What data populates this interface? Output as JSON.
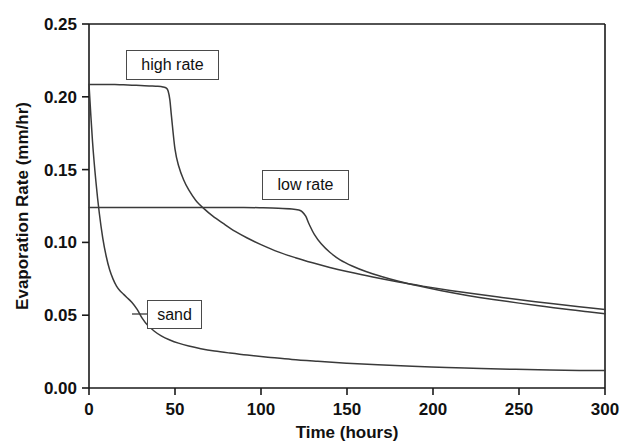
{
  "chart_data": {
    "type": "line",
    "title": "",
    "xlabel": "Time (hours)",
    "ylabel": "Evaporation Rate (mm/hr)",
    "xlim": [
      0,
      300
    ],
    "ylim": [
      0.0,
      0.25
    ],
    "xticks": [
      0,
      50,
      100,
      150,
      200,
      250,
      300
    ],
    "yticks": [
      0.0,
      0.05,
      0.1,
      0.15,
      0.2,
      0.25
    ],
    "xticklabels": [
      "0",
      "50",
      "100",
      "150",
      "200",
      "250",
      "300"
    ],
    "yticklabels": [
      "0.00",
      "0.05",
      "0.10",
      "0.15",
      "0.20",
      "0.25"
    ],
    "grid": false,
    "legend_position": "inline-callouts",
    "annotations": [
      {
        "label": "high rate",
        "x": 47,
        "y": 0.208
      },
      {
        "label": "low rate",
        "x": 125,
        "y": 0.124
      },
      {
        "label": "sand",
        "x": 25,
        "y": 0.035
      }
    ],
    "series": [
      {
        "name": "high rate",
        "x": [
          0,
          5,
          10,
          15,
          20,
          25,
          30,
          35,
          40,
          43,
          45,
          46,
          47,
          48,
          50,
          52,
          55,
          58,
          62,
          67,
          72,
          78,
          85,
          92,
          100,
          110,
          120,
          130,
          140,
          150,
          165,
          180,
          195,
          210,
          225,
          240,
          255,
          270,
          285,
          300
        ],
        "y": [
          0.2085,
          0.2085,
          0.2085,
          0.2085,
          0.2082,
          0.208,
          0.2078,
          0.2075,
          0.2072,
          0.2068,
          0.206,
          0.204,
          0.198,
          0.186,
          0.164,
          0.153,
          0.143,
          0.136,
          0.129,
          0.123,
          0.118,
          0.113,
          0.1075,
          0.103,
          0.0985,
          0.0935,
          0.0895,
          0.086,
          0.0828,
          0.08,
          0.0762,
          0.0728,
          0.0698,
          0.067,
          0.0645,
          0.0622,
          0.06,
          0.0578,
          0.0558,
          0.054
        ]
      },
      {
        "name": "low rate",
        "x": [
          0,
          10,
          20,
          30,
          40,
          50,
          60,
          70,
          80,
          90,
          100,
          110,
          118,
          122,
          124,
          126,
          128,
          131,
          135,
          140,
          146,
          153,
          161,
          170,
          180,
          192,
          205,
          220,
          235,
          250,
          265,
          280,
          290,
          300
        ],
        "y": [
          0.124,
          0.124,
          0.124,
          0.124,
          0.124,
          0.124,
          0.124,
          0.124,
          0.124,
          0.124,
          0.1238,
          0.1235,
          0.123,
          0.1222,
          0.121,
          0.118,
          0.1125,
          0.1055,
          0.099,
          0.0932,
          0.088,
          0.0838,
          0.08,
          0.0766,
          0.0733,
          0.07,
          0.0668,
          0.0636,
          0.0608,
          0.0583,
          0.056,
          0.0537,
          0.0524,
          0.051
        ]
      },
      {
        "name": "sand",
        "x": [
          0,
          2,
          4,
          6,
          8,
          10,
          12,
          14,
          16,
          18,
          20,
          22,
          25,
          28,
          31,
          34,
          38,
          42,
          47,
          52,
          58,
          65,
          73,
          82,
          92,
          104,
          118,
          133,
          150,
          168,
          188,
          208,
          228,
          248,
          268,
          285,
          300
        ],
        "y": [
          0.2085,
          0.17,
          0.142,
          0.12,
          0.103,
          0.0905,
          0.0812,
          0.0748,
          0.07,
          0.0668,
          0.0645,
          0.0622,
          0.0588,
          0.054,
          0.0478,
          0.0432,
          0.039,
          0.0358,
          0.033,
          0.0308,
          0.0288,
          0.027,
          0.0254,
          0.024,
          0.0226,
          0.0212,
          0.0196,
          0.0183,
          0.017,
          0.0159,
          0.0149,
          0.0141,
          0.0134,
          0.0128,
          0.0124,
          0.0121,
          0.012
        ]
      }
    ]
  },
  "axes": {
    "x_title": "Time (hours)",
    "y_title": "Evaporation Rate (mm/hr)"
  },
  "callouts": {
    "high_rate": "high rate",
    "low_rate": "low rate",
    "sand": "sand"
  },
  "colors": {
    "background": "#ffffff",
    "axis": "#1a1a1a",
    "curve": "#3a3a3a",
    "callout_border": "#4a4a4a",
    "text": "#111111"
  }
}
